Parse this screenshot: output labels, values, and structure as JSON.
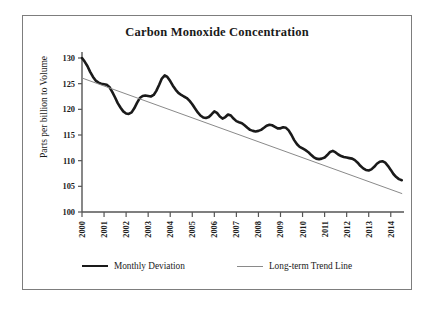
{
  "chart_data": {
    "type": "line",
    "title": "Carbon Monoxide Concentration",
    "xlabel": "",
    "ylabel": "Parts per billion to Volume",
    "ylim": [
      100,
      130
    ],
    "yticks": [
      100,
      105,
      110,
      115,
      120,
      125,
      130
    ],
    "xlim": [
      2000,
      2014.6
    ],
    "categories": [
      "2000",
      "2001",
      "2002",
      "2003",
      "2004",
      "2005",
      "2006",
      "2007",
      "2008",
      "2009",
      "2010",
      "2011",
      "2012",
      "2013",
      "2014"
    ],
    "xticks": [
      2000,
      2001,
      2002,
      2003,
      2004,
      2005,
      2006,
      2007,
      2008,
      2009,
      2010,
      2011,
      2012,
      2013,
      2014
    ],
    "grid": false,
    "legend_position": "bottom",
    "series": [
      {
        "name": "Monthly Deviation",
        "color": "#1a1a1a",
        "linewidth": 2.6,
        "x": [
          2000.0,
          2000.12,
          2000.25,
          2000.37,
          2000.5,
          2000.62,
          2000.75,
          2000.87,
          2001.0,
          2001.12,
          2001.25,
          2001.37,
          2001.5,
          2001.62,
          2001.75,
          2001.87,
          2002.0,
          2002.12,
          2002.25,
          2002.37,
          2002.5,
          2002.62,
          2002.75,
          2002.87,
          2003.0,
          2003.12,
          2003.25,
          2003.37,
          2003.5,
          2003.62,
          2003.75,
          2003.87,
          2004.0,
          2004.12,
          2004.25,
          2004.37,
          2004.5,
          2004.62,
          2004.75,
          2004.87,
          2005.0,
          2005.12,
          2005.25,
          2005.37,
          2005.5,
          2005.62,
          2005.75,
          2005.87,
          2006.0,
          2006.12,
          2006.25,
          2006.37,
          2006.5,
          2006.62,
          2006.75,
          2006.87,
          2007.0,
          2007.12,
          2007.25,
          2007.37,
          2007.5,
          2007.62,
          2007.75,
          2007.87,
          2008.0,
          2008.12,
          2008.25,
          2008.37,
          2008.5,
          2008.62,
          2008.75,
          2008.87,
          2009.0,
          2009.12,
          2009.25,
          2009.37,
          2009.5,
          2009.62,
          2009.75,
          2009.87,
          2010.0,
          2010.12,
          2010.25,
          2010.37,
          2010.5,
          2010.62,
          2010.75,
          2010.87,
          2011.0,
          2011.12,
          2011.25,
          2011.37,
          2011.5,
          2011.62,
          2011.75,
          2011.87,
          2012.0,
          2012.12,
          2012.25,
          2012.37,
          2012.5,
          2012.62,
          2012.75,
          2012.87,
          2013.0,
          2013.12,
          2013.25,
          2013.37,
          2013.5,
          2013.62,
          2013.75,
          2013.87,
          2014.0,
          2014.12,
          2014.25,
          2014.37,
          2014.5
        ],
        "values": [
          130.0,
          129.3,
          128.4,
          127.3,
          126.3,
          125.6,
          125.2,
          125.0,
          124.9,
          124.8,
          124.3,
          123.4,
          122.3,
          121.2,
          120.3,
          119.6,
          119.2,
          119.1,
          119.4,
          120.2,
          121.3,
          122.2,
          122.6,
          122.7,
          122.6,
          122.5,
          122.8,
          123.6,
          124.8,
          126.0,
          126.6,
          126.3,
          125.5,
          124.6,
          123.8,
          123.2,
          122.8,
          122.5,
          122.2,
          121.7,
          121.0,
          120.2,
          119.4,
          118.8,
          118.4,
          118.3,
          118.5,
          119.0,
          119.6,
          119.3,
          118.6,
          118.2,
          118.5,
          119.0,
          118.8,
          118.2,
          117.7,
          117.5,
          117.3,
          116.9,
          116.4,
          116.0,
          115.8,
          115.7,
          115.8,
          116.0,
          116.4,
          116.8,
          117.0,
          116.9,
          116.6,
          116.3,
          116.3,
          116.5,
          116.4,
          115.9,
          115.0,
          114.0,
          113.2,
          112.7,
          112.4,
          112.1,
          111.7,
          111.2,
          110.7,
          110.4,
          110.3,
          110.4,
          110.6,
          111.1,
          111.7,
          111.9,
          111.6,
          111.2,
          110.9,
          110.7,
          110.6,
          110.5,
          110.4,
          110.1,
          109.6,
          109.0,
          108.5,
          108.2,
          108.1,
          108.3,
          108.8,
          109.4,
          109.8,
          109.9,
          109.6,
          109.0,
          108.2,
          107.4,
          106.8,
          106.4,
          106.2
        ]
      },
      {
        "name": "Long-term Trend Line",
        "color": "#8a8a8a",
        "linewidth": 1.0,
        "x": [
          2000.0,
          2014.5
        ],
        "values": [
          126.1,
          103.6
        ]
      }
    ]
  },
  "legend": {
    "entries": [
      {
        "label": "Monthly Deviation"
      },
      {
        "label": "Long-term Trend Line"
      }
    ]
  }
}
